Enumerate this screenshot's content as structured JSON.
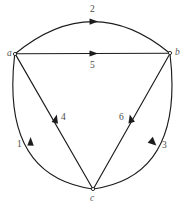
{
  "diagram": {
    "background_color": "#ffffff",
    "stroke_color": "#1c1c1c",
    "label_color": "#4a4a4a",
    "vertices": [
      {
        "id": "a",
        "label": "a",
        "x": 15,
        "y": 54,
        "label_x": 7,
        "label_y": 49
      },
      {
        "id": "b",
        "label": "b",
        "x": 170,
        "y": 53,
        "label_x": 175,
        "label_y": 48
      },
      {
        "id": "c",
        "label": "c",
        "x": 93,
        "y": 189,
        "label_x": 90,
        "label_y": 194
      }
    ],
    "edges": [
      {
        "id": "e2",
        "label": "2",
        "from": "a",
        "to": "b",
        "shape": "arc",
        "label_x": 90,
        "label_y": 5
      },
      {
        "id": "e5",
        "label": "5",
        "from": "a",
        "to": "b",
        "shape": "straight",
        "label_x": 90,
        "label_y": 61
      },
      {
        "id": "e1",
        "label": "1",
        "from": "c",
        "to": "a",
        "shape": "arc",
        "label_x": 17,
        "label_y": 140
      },
      {
        "id": "e3",
        "label": "3",
        "from": "b",
        "to": "c",
        "shape": "arc",
        "label_x": 162,
        "label_y": 141
      },
      {
        "id": "e4",
        "label": "4",
        "from": "c",
        "to": "a",
        "shape": "straight",
        "label_x": 61,
        "label_y": 113
      },
      {
        "id": "e6",
        "label": "6",
        "from": "c",
        "to": "b",
        "shape": "straight",
        "label_x": 119,
        "label_y": 113
      }
    ]
  }
}
